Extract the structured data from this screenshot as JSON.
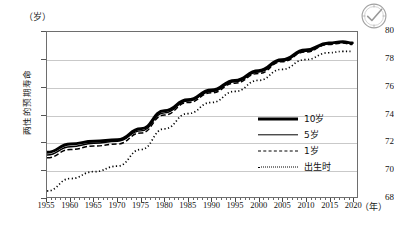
{
  "icons": {
    "seal": "verified-seal-icon"
  },
  "axis": {
    "y_unit": "（岁）",
    "x_unit": "（年）",
    "y_title": "两性的预期寿命",
    "y_ticks": [
      68,
      70,
      72,
      74,
      76,
      78,
      80
    ],
    "x_ticks": [
      1955,
      1960,
      1965,
      1970,
      1975,
      1980,
      1985,
      1990,
      1995,
      2000,
      2005,
      2010,
      2015,
      2020
    ]
  },
  "legend": {
    "items": [
      {
        "label": "10岁",
        "style": "solid-thick"
      },
      {
        "label": "5岁",
        "style": "solid-thin"
      },
      {
        "label": "1岁",
        "style": "dashed"
      },
      {
        "label": "出生时",
        "style": "dotted"
      }
    ]
  },
  "chart_data": {
    "type": "line",
    "title": "",
    "xlabel": "（年）",
    "ylabel": "两性的预期寿命（岁）",
    "xlim": [
      1955,
      2021
    ],
    "ylim": [
      68,
      80
    ],
    "grid": true,
    "legend_position": "inside-right",
    "x": [
      1955,
      1960,
      1965,
      1970,
      1975,
      1980,
      1985,
      1990,
      1995,
      2000,
      2005,
      2010,
      2015,
      2018,
      2020
    ],
    "series": [
      {
        "name": "10岁",
        "style": "solid-thick",
        "values": [
          71.3,
          71.9,
          72.1,
          72.2,
          73.0,
          74.3,
          75.1,
          75.8,
          76.5,
          77.2,
          78.0,
          78.7,
          79.2,
          79.3,
          79.2
        ]
      },
      {
        "name": "5岁",
        "style": "solid-thin",
        "values": [
          71.1,
          71.7,
          71.95,
          72.1,
          72.85,
          74.15,
          75.0,
          75.7,
          76.4,
          77.1,
          77.9,
          78.6,
          79.15,
          79.25,
          79.15
        ]
      },
      {
        "name": "1岁",
        "style": "dashed",
        "values": [
          70.9,
          71.5,
          71.75,
          71.9,
          72.7,
          74.0,
          74.9,
          75.6,
          76.3,
          77.0,
          77.85,
          78.55,
          79.1,
          79.2,
          79.1
        ]
      },
      {
        "name": "出生时",
        "style": "dotted",
        "values": [
          68.5,
          69.4,
          69.9,
          70.3,
          71.5,
          73.0,
          74.1,
          74.9,
          75.7,
          76.5,
          77.3,
          78.0,
          78.5,
          78.6,
          78.6
        ]
      }
    ]
  }
}
